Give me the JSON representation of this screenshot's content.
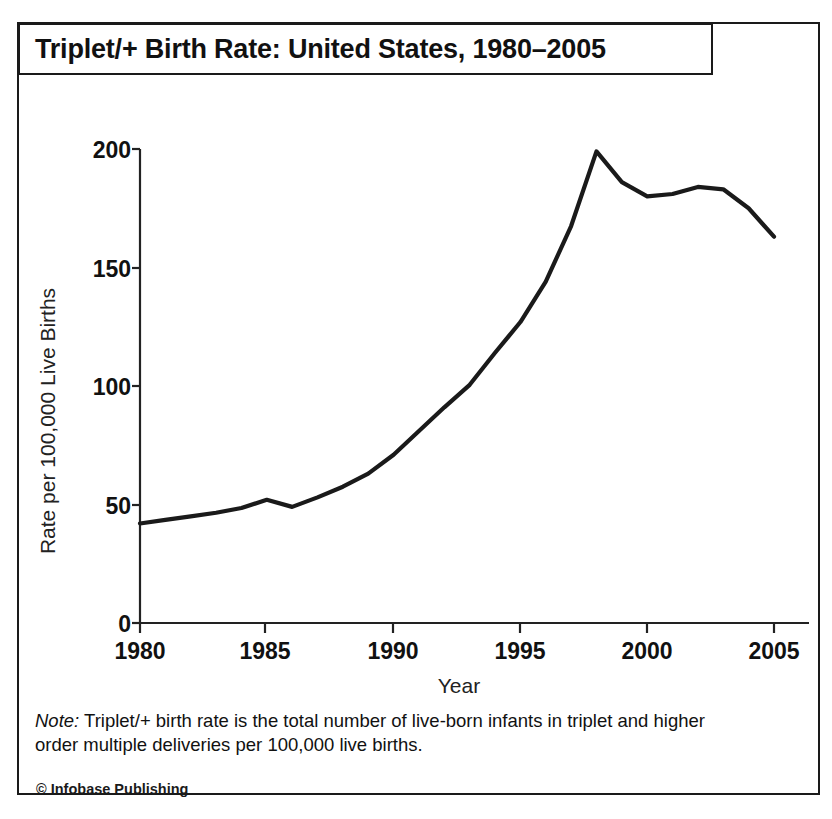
{
  "figure": {
    "title": "Triplet/+ Birth Rate: United States, 1980–2005",
    "note_label": "Note:",
    "note_text": " Triplet/+ birth rate is the total number of live-born infants in triplet and higher order multiple deliveries per 100,000 live births.",
    "credit": "© Infobase Publishing",
    "line_color": "#1a1a1a",
    "frame_color": "#1a1a1a"
  },
  "chart_data": {
    "type": "line",
    "title": "Triplet/+ Birth Rate: United States, 1980–2005",
    "xlabel": "Year",
    "ylabel": "Rate per 100,000 Live Births",
    "xlim": [
      1980,
      2005
    ],
    "ylim": [
      0,
      200
    ],
    "xticks": [
      1980,
      1985,
      1990,
      1995,
      2000,
      2005
    ],
    "yticks": [
      0,
      50,
      100,
      150,
      200
    ],
    "grid": false,
    "legend": false,
    "series": [
      {
        "name": "Triplet/+ birth rate",
        "x": [
          1980,
          1981,
          1982,
          1983,
          1984,
          1985,
          1986,
          1987,
          1988,
          1989,
          1990,
          1991,
          1992,
          1993,
          1994,
          1995,
          1996,
          1997,
          1998,
          1999,
          2000,
          2001,
          2002,
          2003,
          2004,
          2005
        ],
        "values": [
          42,
          43.5,
          45,
          46.5,
          48.5,
          52,
          49,
          53,
          57.5,
          63,
          71,
          81,
          91,
          100.5,
          114,
          127,
          144,
          167.5,
          199,
          186,
          180,
          181,
          184,
          183,
          175,
          163
        ]
      }
    ]
  }
}
